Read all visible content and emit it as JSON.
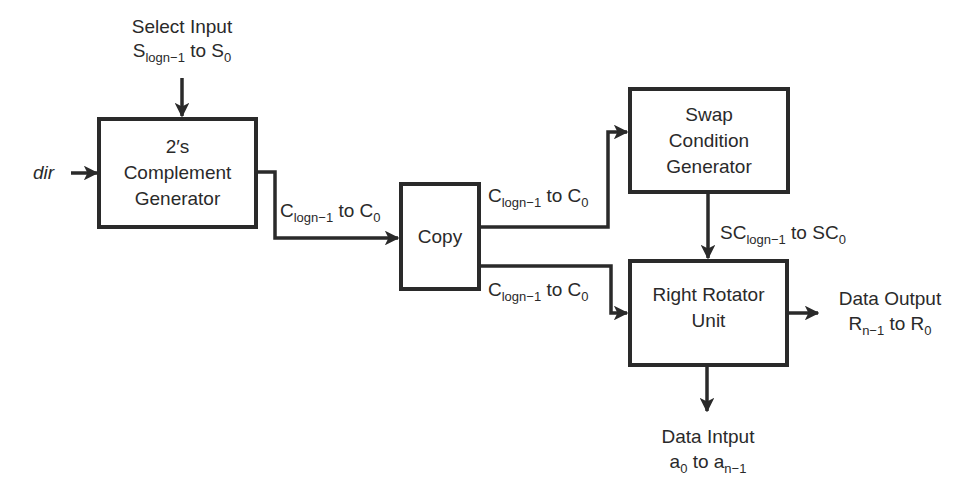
{
  "diagram": {
    "type": "block-diagram",
    "blocks": {
      "complement": {
        "line1": "2′s",
        "line2": "Complement",
        "line3": "Generator"
      },
      "copy": {
        "label": "Copy"
      },
      "swap": {
        "line1": "Swap",
        "line2": "Condition",
        "line3": "Generator"
      },
      "rotator": {
        "line1": "Right Rotator",
        "line2": "Unit"
      }
    },
    "labels": {
      "select_input": {
        "title": "Select Input",
        "base1": "S",
        "sub1": "logn−1",
        "mid": " to ",
        "base2": "S",
        "sub2": "0"
      },
      "dir": "dir",
      "c_to_copy": {
        "base1": "C",
        "sub1": "logn−1",
        "mid": " to ",
        "base2": "C",
        "sub2": "0"
      },
      "c_to_swap": {
        "base1": "C",
        "sub1": "logn−1",
        "mid": " to ",
        "base2": "C",
        "sub2": "0"
      },
      "c_to_rotator": {
        "base1": "C",
        "sub1": "logn−1",
        "mid": " to ",
        "base2": "C",
        "sub2": "0"
      },
      "sc": {
        "base1": "SC",
        "sub1": "logn−1",
        "mid": " to ",
        "base2": "SC",
        "sub2": "0"
      },
      "data_output": {
        "title": "Data Output",
        "base1": "R",
        "sub1": "n−1",
        "mid": " to ",
        "base2": "R",
        "sub2": "0"
      },
      "data_input": {
        "title": "Data Intput",
        "base1": "a",
        "sub1": "0",
        "mid": " to ",
        "base2": "a",
        "sub2": "n−1"
      }
    },
    "colors": {
      "line": "#2a2a2a",
      "background": "#ffffff"
    }
  }
}
